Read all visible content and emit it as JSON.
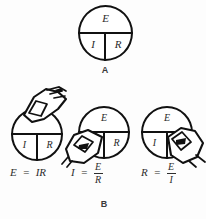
{
  "figure": {
    "title_a": "A",
    "title_b": "B",
    "background_color": "#fdfdfd",
    "ink_color": "#111111",
    "text_color": "#2e2e2e"
  },
  "wheel": {
    "top_label": "E",
    "bottom_left_label": "I",
    "bottom_right_label": "R"
  },
  "panel_a": {
    "caption": "A",
    "segments": {
      "top": "E",
      "bottom_left": "I",
      "bottom_right": "R"
    }
  },
  "panel_b": {
    "caption": "B",
    "cases": [
      {
        "covered_segment": "E",
        "visible_top": "",
        "visible_bottom_left": "I",
        "visible_bottom_right": "R",
        "formula_lhs": "E",
        "formula_eq": "=",
        "formula_rhs_type": "inline",
        "formula_rhs": "IR",
        "formula_text": "E = IR"
      },
      {
        "covered_segment": "I",
        "visible_top": "E",
        "visible_bottom_left": "",
        "visible_bottom_right": "R",
        "formula_lhs": "I",
        "formula_eq": "=",
        "formula_rhs_type": "fraction",
        "formula_numerator": "E",
        "formula_denominator": "R",
        "formula_text": "I = E/R"
      },
      {
        "covered_segment": "R",
        "visible_top": "E",
        "visible_bottom_left": "I",
        "visible_bottom_right": "",
        "formula_lhs": "R",
        "formula_eq": "=",
        "formula_rhs_type": "fraction",
        "formula_numerator": "E",
        "formula_denominator": "I",
        "formula_text": "R = E/I"
      }
    ]
  }
}
